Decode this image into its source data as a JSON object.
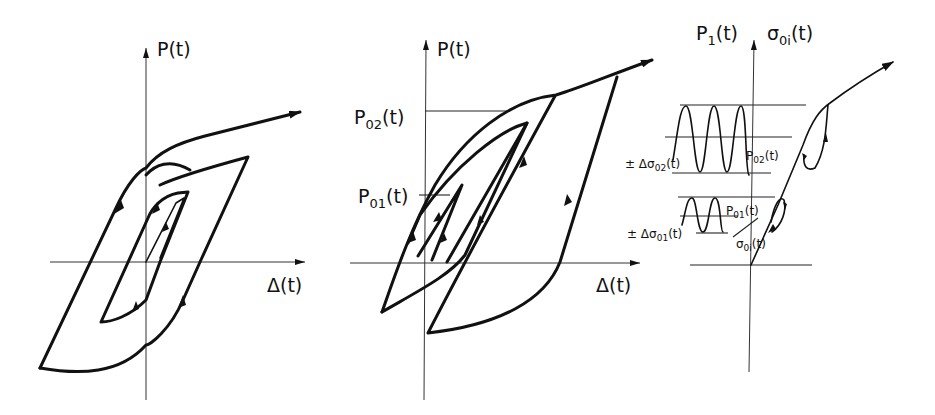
{
  "figure": {
    "panels": [
      {
        "id": "panel-1",
        "y_axis_label": "P(t)",
        "x_axis_label": "Δ(t)",
        "description": "Hysteresis loops: large outer loop and small inner loop with direction arrows"
      },
      {
        "id": "panel-2",
        "y_axis_label": "P(t)",
        "x_axis_label": "Δ(t)",
        "level_labels": [
          "P02(t)",
          "P01(t)"
        ],
        "level_labels_display": {
          "p02": "P",
          "p02_sub": "02",
          "p02_tail": "(t)",
          "p01": "P",
          "p01_sub": "01",
          "p01_tail": "(t)"
        },
        "description": "Nested hysteresis loops at load levels P01 and P02"
      },
      {
        "id": "panel-3",
        "y_axis_label_left": {
          "main": "P",
          "sub": "1",
          "tail": "(t)"
        },
        "y_axis_label_right": {
          "main": "σ",
          "sub": "0i",
          "tail": "(t)"
        },
        "amplitude_labels": [
          {
            "prefix": "± Δσ",
            "sub": "02",
            "tail": "(t)"
          },
          {
            "prefix": "± Δσ",
            "sub": "01",
            "tail": "(t)"
          }
        ],
        "level_labels": [
          {
            "main": "P",
            "sub": "02",
            "tail": "(t)"
          },
          {
            "main": "P",
            "sub": "01",
            "tail": "(t)"
          }
        ],
        "curve_label": {
          "main": "σ",
          "sub": "0i",
          "tail": "(t)"
        },
        "description": "Cyclic load signal with amplitude bands and resulting stress-strain path with small loops"
      }
    ]
  }
}
